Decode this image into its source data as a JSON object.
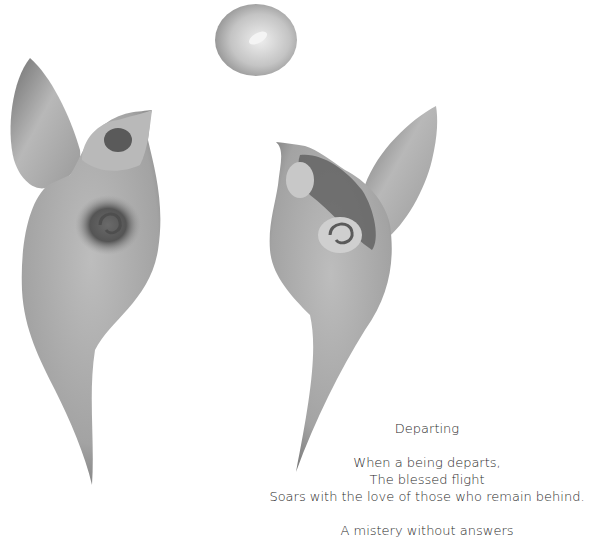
{
  "artwork": {
    "description": "watercolor illustration of two abstract bird-like figures with a moon",
    "colors": {
      "ink_dark": "#4a4a4a",
      "ink_mid": "#8a8a8a",
      "ink_light": "#c9c9c9",
      "paper": "#ffffff"
    }
  },
  "poem": {
    "title": "Departing",
    "stanzas": [
      {
        "lines": [
          "When a being departs,",
          "The blessed flight",
          "Soars with the love of those who remain behind."
        ]
      },
      {
        "lines": [
          "A mistery without answers"
        ]
      }
    ]
  }
}
